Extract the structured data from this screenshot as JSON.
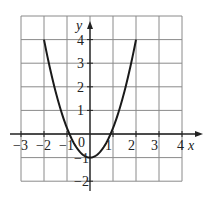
{
  "chart_data": {
    "type": "line",
    "title": "",
    "xlabel": "x",
    "ylabel": "y",
    "xlim": [
      -3,
      4
    ],
    "ylim": [
      -2,
      5
    ],
    "grid": true,
    "x_ticks": [
      "-3",
      "-2",
      "-1",
      "0",
      "1",
      "2",
      "3",
      "4"
    ],
    "y_ticks": [
      "-2",
      "-1",
      "1",
      "2",
      "3",
      "4"
    ],
    "origin_label": "0",
    "series": [
      {
        "name": "y = x^2 - 1",
        "x": [
          -2,
          -1.5,
          -1,
          -0.5,
          0,
          0.5,
          1,
          1.5,
          2
        ],
        "y": [
          3,
          1.25,
          0,
          -0.75,
          -1,
          -0.75,
          0,
          1.25,
          3
        ]
      }
    ],
    "curve_endpoints": [
      [
        -2,
        4
      ],
      [
        2,
        4
      ]
    ]
  },
  "colors": {
    "grid": "#8a8a8a",
    "axis": "#222222",
    "curve": "#1a1a1a"
  }
}
